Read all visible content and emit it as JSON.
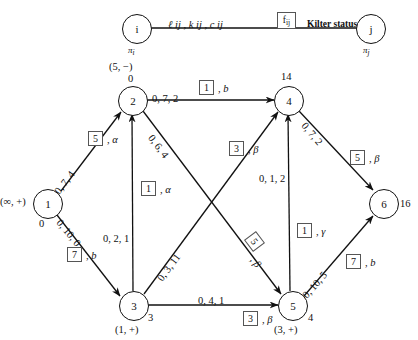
{
  "diagram": {
    "legend": {
      "node_i": "i",
      "node_i_pi": "π",
      "node_i_pi_sub": "i",
      "arc_params": "ℓ ij , k ij , c ij",
      "flow_box": "f",
      "flow_box_sub": "ij",
      "status_text": "Kilter status",
      "node_j": "j",
      "node_j_pi": "π",
      "node_j_pi_sub": "j"
    },
    "nodes": [
      {
        "id": "1",
        "label": "1",
        "potential": "0",
        "tag": "(∞, +)",
        "x": 47,
        "y": 203
      },
      {
        "id": "2",
        "label": "2",
        "potential": "0",
        "tag": "(5, −)",
        "x": 132,
        "y": 100
      },
      {
        "id": "3",
        "label": "3",
        "potential": "3",
        "tag": "(1, +)",
        "x": 133,
        "y": 305
      },
      {
        "id": "4",
        "label": "4",
        "potential": "14",
        "tag": "",
        "x": 288,
        "y": 100
      },
      {
        "id": "5",
        "label": "5",
        "potential": "4",
        "tag": "(3, +)",
        "x": 292,
        "y": 305
      },
      {
        "id": "6",
        "label": "6",
        "potential": "16",
        "tag": "",
        "x": 383,
        "y": 203
      }
    ],
    "arcs": [
      {
        "from": "1",
        "to": "2",
        "params": "0, 7, 4",
        "flow": "5",
        "status": "α"
      },
      {
        "from": "1",
        "to": "3",
        "params": "0, 10, 0",
        "flow": "7",
        "status": "b"
      },
      {
        "from": "2",
        "to": "4",
        "params": "0, 7, 2",
        "flow": "1",
        "status": "b"
      },
      {
        "from": "2",
        "to": "5",
        "params": "0, 6, 4",
        "flow": "5",
        "status": "β"
      },
      {
        "from": "3",
        "to": "2",
        "params": "0, 2, 1",
        "flow": "1",
        "status": "α"
      },
      {
        "from": "3",
        "to": "4",
        "params": "0, 3, 11",
        "flow": "3",
        "status": "β"
      },
      {
        "from": "3",
        "to": "5",
        "params": "0, 4, 1",
        "flow": "3",
        "status": "β"
      },
      {
        "from": "4",
        "to": "6",
        "params": "0, 7, 2",
        "flow": "5",
        "status": "β"
      },
      {
        "from": "5",
        "to": "4",
        "params": "0, 1, 2",
        "flow": "1",
        "status": "γ"
      },
      {
        "from": "5",
        "to": "6",
        "params": "0, 10, 5",
        "flow": "7",
        "status": "b"
      }
    ],
    "colors": {
      "ink": "#111111",
      "box_border": "#555555",
      "paper": "#ffffff"
    }
  }
}
